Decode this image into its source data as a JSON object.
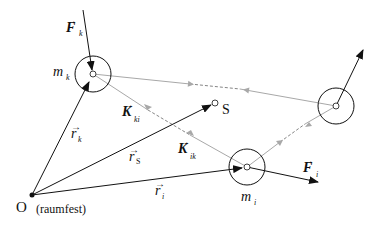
{
  "diagram": {
    "colors": {
      "line": "#111111",
      "gray": "#a8a8a8",
      "background": "#ffffff"
    },
    "origin": {
      "label": "O",
      "note": "(raumfest)"
    },
    "center_of_mass": {
      "label": "S"
    },
    "masses": [
      {
        "id": "k",
        "label": "m",
        "sub": "k"
      },
      {
        "id": "i",
        "label": "m",
        "sub": "i"
      },
      {
        "id": "third",
        "label": "",
        "sub": ""
      }
    ],
    "position_vectors": [
      {
        "label": "r",
        "sub": "k"
      },
      {
        "label": "r",
        "sub": "S"
      },
      {
        "label": "r",
        "sub": "i"
      }
    ],
    "forces": [
      {
        "label": "F",
        "sub": "k"
      },
      {
        "label": "F",
        "sub": "i"
      }
    ],
    "internal_forces": [
      {
        "label": "K",
        "sub": "ki"
      },
      {
        "label": "K",
        "sub": "ik"
      }
    ]
  }
}
